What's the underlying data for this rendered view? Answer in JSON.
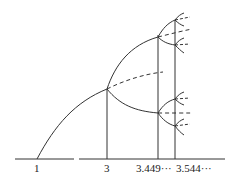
{
  "diagram": {
    "type": "bifurcation-diagram",
    "axis_labels": [
      {
        "id": "r1",
        "text": "1",
        "x": 37
      },
      {
        "id": "r3",
        "text": "3",
        "x": 107
      },
      {
        "id": "r3449",
        "text": "3.449···",
        "x": 158
      },
      {
        "id": "r3544",
        "text": "3.544···",
        "x": 175
      }
    ],
    "colors": {
      "stroke": "#333333",
      "background": "#ffffff"
    }
  }
}
